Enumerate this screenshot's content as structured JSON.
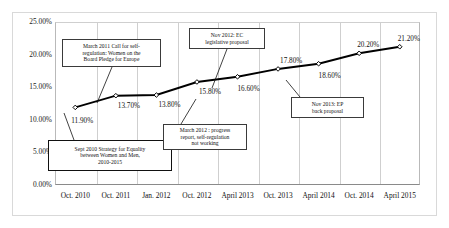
{
  "chart_data": {
    "type": "line",
    "title": "",
    "xlabel": "",
    "ylabel": "",
    "categories": [
      "Oct. 2010",
      "Oct. 2011",
      "Jan. 2012",
      "Oct. 2012",
      "April 2013",
      "Oct. 2013",
      "April 2014",
      "Oct. 2014",
      "April 2015"
    ],
    "values": [
      11.9,
      13.7,
      13.8,
      15.8,
      16.6,
      17.8,
      18.6,
      20.2,
      21.2
    ],
    "value_labels": [
      "11.90%",
      "13.70%",
      "13.80%",
      "15.80%",
      "16.60%",
      "17.80%",
      "18.60%",
      "20.20%",
      "21.20%"
    ],
    "ylim": [
      0,
      25
    ],
    "ytick_labels": [
      "25.00%",
      "20.00%",
      "15.00%",
      "10.00%",
      "5.00%",
      "0.00%"
    ],
    "ytick_values": [
      25,
      20,
      15,
      10,
      5,
      0
    ],
    "grid": "vertical",
    "legend": "none",
    "series_color": "#000000",
    "marker": "diamond",
    "annotations": [
      {
        "id": "mar-2011",
        "lines": [
          "March 2011 Call for self-",
          "regulation: Women on the",
          "Board Pledge for Europe"
        ]
      },
      {
        "id": "sept-2010",
        "lines": [
          "Sept 2010 Strategy for Equality",
          "between Women and Men,",
          "2010-2015"
        ]
      },
      {
        "id": "nov-2012",
        "lines": [
          "Nov 2012: EC",
          "legislative proposal"
        ]
      },
      {
        "id": "mar-2012",
        "lines": [
          "March 2012 : progress",
          "report, self-regulation",
          "not working"
        ]
      },
      {
        "id": "nov-2013",
        "lines": [
          "Nov 2013: EP",
          "back proposal"
        ]
      }
    ]
  }
}
